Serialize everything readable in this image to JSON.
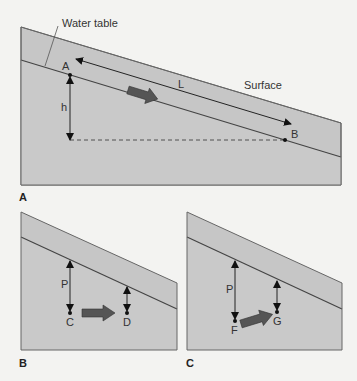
{
  "colors": {
    "background": "#f3f3f1",
    "soil_upper": "#c4c4c4",
    "soil_lower": "#c9c9c9",
    "outline": "#555555",
    "flow_arrow": "#555555",
    "text": "#333333"
  },
  "panel_a": {
    "label": "A",
    "water_table_label": "Water table",
    "surface_label": "Surface",
    "point_a": "A",
    "point_b": "B",
    "length_label": "L",
    "head_label": "h"
  },
  "panel_b": {
    "label": "B",
    "pressure_label": "P",
    "point_c": "C",
    "point_d": "D"
  },
  "panel_c": {
    "label": "C",
    "pressure_label": "P",
    "point_f": "F",
    "point_g": "G"
  }
}
